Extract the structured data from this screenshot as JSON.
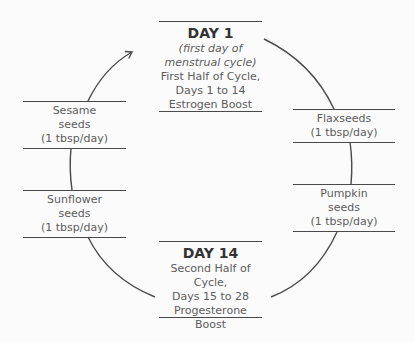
{
  "diagram": {
    "type": "cycle",
    "direction": "clockwise",
    "nodes": [
      {
        "id": "day1",
        "title": "DAY 1",
        "subtitle": "(first day of menstrual cycle)",
        "subtitle_lines": [
          "(first day of",
          "menstrual cycle)"
        ],
        "lines": [
          "First Half of Cycle,",
          "Days 1 to 14",
          "Estrogen Boost"
        ]
      },
      {
        "id": "flaxseeds",
        "lines": [
          "Flaxseeds",
          "(1 tbsp/day)"
        ]
      },
      {
        "id": "pumpkin",
        "lines": [
          "Pumpkin",
          "seeds",
          "(1 tbsp/day)"
        ]
      },
      {
        "id": "day14",
        "title": "DAY 14",
        "lines": [
          "Second Half of Cycle,",
          "Days 15 to 28",
          "Progesterone",
          "Boost"
        ]
      },
      {
        "id": "sunflower",
        "lines": [
          "Sunflower",
          "seeds",
          "(1 tbsp/day)"
        ]
      },
      {
        "id": "sesame",
        "lines": [
          "Sesame",
          "seeds",
          "(1 tbsp/day)"
        ]
      }
    ],
    "colors": {
      "line": "#4a4a4a",
      "title_text": "#333333",
      "body_text": "#5c5c5c",
      "background": "#fbfbfb"
    }
  }
}
